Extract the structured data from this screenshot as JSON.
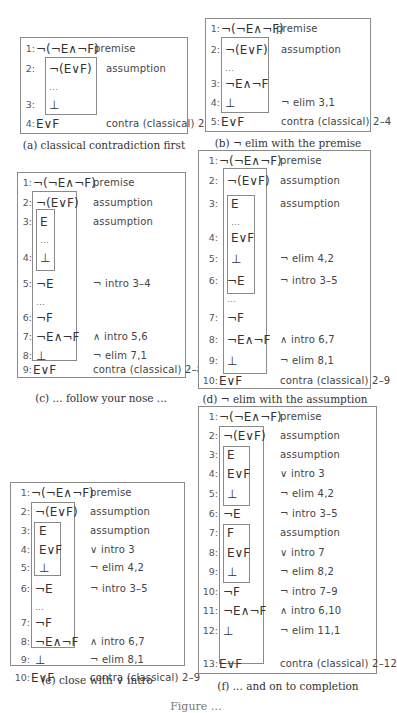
{
  "panels": [
    {
      "id": "a",
      "caption": "(a) classical contradiction first",
      "box": {
        "left": 20,
        "top": 37,
        "width": 168,
        "height": 97
      },
      "caption_top": 139,
      "caption_center": 104,
      "subproofs": [
        {
          "left": 24,
          "top": 19,
          "width": 52,
          "height": 58
        }
      ],
      "rows": [
        {
          "top": 2,
          "ln": "1:",
          "formula": "¬(¬E∧¬F)",
          "just": "premise",
          "just_left": 73
        },
        {
          "top": 22,
          "ln": "2:",
          "formula": "¬(E∨F)",
          "just": "assumption",
          "just_left": 85
        },
        {
          "top": 40,
          "dots": "…"
        },
        {
          "top": 58,
          "ln": "3:",
          "formula": "⊥",
          "just": ""
        },
        {
          "top": 77,
          "ln": "4:",
          "formula": "E∨F",
          "just": "contra (classical) 2–3",
          "just_left": 85
        }
      ]
    },
    {
      "id": "b",
      "caption": "(b) ¬ elim with the premise",
      "box": {
        "left": 205,
        "top": 18,
        "width": 166,
        "height": 114
      },
      "caption_top": 137,
      "caption_center": 288,
      "subproofs": [
        {
          "left": 15,
          "top": 18,
          "width": 48,
          "height": 76
        }
      ],
      "rows": [
        {
          "top": 1,
          "ln": "1:",
          "formula": "¬(¬E∧¬F)",
          "just": "premise",
          "just_left": 70
        },
        {
          "top": 22,
          "ln": "2:",
          "formula": "¬(E∨F)",
          "just": "assumption",
          "just_left": 75
        },
        {
          "top": 40,
          "dots": "…"
        },
        {
          "top": 56,
          "ln": "3:",
          "formula": "¬E∧¬F",
          "just": ""
        },
        {
          "top": 75,
          "ln": "4:",
          "formula": "⊥",
          "just": "¬ elim 3,1",
          "just_left": 75
        },
        {
          "top": 94,
          "ln": "5:",
          "formula": "E∨F",
          "just": "contra (classical) 2–4",
          "just_left": 75
        }
      ]
    },
    {
      "id": "c",
      "caption": "(c) ... follow your nose ...",
      "box": {
        "left": 17,
        "top": 172,
        "width": 169,
        "height": 206
      },
      "caption_top": 392,
      "caption_center": 101,
      "subproofs": [
        {
          "left": 14,
          "top": 18,
          "width": 45,
          "height": 170
        },
        {
          "left": 18,
          "top": 36,
          "width": 19,
          "height": 62
        }
      ],
      "rows": [
        {
          "top": 1,
          "ln": "1:",
          "formula": "¬(¬E∧¬F)",
          "just": "premise",
          "just_left": 75
        },
        {
          "top": 21,
          "ln": "2:",
          "formula": "¬(E∨F)",
          "just": "assumption",
          "just_left": 75
        },
        {
          "top": 40,
          "ln": "3:",
          "formula": "E",
          "just": "assumption",
          "just_left": 75,
          "indent": 1
        },
        {
          "top": 58,
          "dots": "…",
          "indent": 1
        },
        {
          "top": 76,
          "ln": "4:",
          "formula": "⊥",
          "just": "",
          "indent": 1
        },
        {
          "top": 102,
          "ln": "5:",
          "formula": "¬E",
          "just": "¬ intro 3–4",
          "just_left": 75
        },
        {
          "top": 120,
          "dots": "…"
        },
        {
          "top": 136,
          "ln": "6:",
          "formula": "¬F",
          "just": ""
        },
        {
          "top": 155,
          "ln": "7:",
          "formula": "¬E∧¬F",
          "just": "∧ intro 5,6",
          "just_left": 75
        },
        {
          "top": 174,
          "ln": "8:",
          "formula": "⊥",
          "just": "¬ elim 7,1",
          "just_left": 75
        },
        {
          "top": 188,
          "ln": "9:",
          "formula": "E∨F",
          "just": "contra (classical) 2–8",
          "just_left": 75
        }
      ]
    },
    {
      "id": "d",
      "caption": "(d) ¬ elim with the assumption",
      "box": {
        "left": 198,
        "top": 150,
        "width": 173,
        "height": 239
      },
      "caption_top": 393,
      "caption_center": 285,
      "subproofs": [
        {
          "left": 24,
          "top": 17,
          "width": 44,
          "height": 206
        },
        {
          "left": 28,
          "top": 44,
          "width": 28,
          "height": 99
        }
      ],
      "rows": [
        {
          "top": 1,
          "ln": "1:",
          "formula": "¬(¬E∧¬F)",
          "just": "premise",
          "just_left": 81
        },
        {
          "top": 21,
          "ln": "2:",
          "formula": "¬(E∨F)",
          "just": "assumption",
          "just_left": 81
        },
        {
          "top": 44,
          "ln": "3:",
          "formula": "E",
          "just": "assumption",
          "just_left": 81,
          "indent": 1
        },
        {
          "top": 62,
          "dots": "…",
          "indent": 1
        },
        {
          "top": 78,
          "ln": "4:",
          "formula": "E∨F",
          "just": "",
          "indent": 1
        },
        {
          "top": 99,
          "ln": "5:",
          "formula": "⊥",
          "just": "¬ elim 4,2",
          "just_left": 81,
          "indent": 1
        },
        {
          "top": 121,
          "ln": "6:",
          "formula": "¬E",
          "just": "¬ intro 3–5",
          "just_left": 81
        },
        {
          "top": 139,
          "dots": "…"
        },
        {
          "top": 158,
          "ln": "7:",
          "formula": "¬F",
          "just": ""
        },
        {
          "top": 180,
          "ln": "8:",
          "formula": "¬E∧¬F",
          "just": "∧ intro 6,7",
          "just_left": 81
        },
        {
          "top": 201,
          "ln": "9:",
          "formula": "⊥",
          "just": "¬ elim 8,1",
          "just_left": 81
        },
        {
          "top": 221,
          "ln": "10:",
          "formula": "E∨F",
          "just": "contra (classical) 2–9",
          "just_left": 81
        }
      ]
    },
    {
      "id": "e",
      "caption": "(e) close with ∨ intro",
      "box": {
        "left": 10,
        "top": 482,
        "width": 175,
        "height": 184
      },
      "caption_top": 674,
      "caption_center": 97,
      "subproofs": [
        {
          "left": 20,
          "top": 19,
          "width": 44,
          "height": 146
        },
        {
          "left": 23,
          "top": 39,
          "width": 27,
          "height": 54
        }
      ],
      "rows": [
        {
          "top": 1,
          "ln": "1:",
          "formula": "¬(¬E∧¬F)",
          "just": "premise",
          "just_left": 79
        },
        {
          "top": 20,
          "ln": "2:",
          "formula": "¬(E∨F)",
          "just": "assumption",
          "just_left": 79
        },
        {
          "top": 39,
          "ln": "3:",
          "formula": "E",
          "just": "assumption",
          "just_left": 79,
          "indent": 1
        },
        {
          "top": 58,
          "ln": "4:",
          "formula": "E∨F",
          "just": "∨ intro 3",
          "just_left": 79,
          "indent": 1
        },
        {
          "top": 76,
          "ln": "5:",
          "formula": "⊥",
          "just": "¬ elim 4,2",
          "just_left": 79,
          "indent": 1
        },
        {
          "top": 97,
          "ln": "6:",
          "formula": "¬E",
          "just": "¬ intro 3–5",
          "just_left": 79
        },
        {
          "top": 115,
          "dots": "…"
        },
        {
          "top": 131,
          "ln": "7:",
          "formula": "¬F",
          "just": ""
        },
        {
          "top": 150,
          "ln": "8:",
          "formula": "¬E∧¬F",
          "just": "∧ intro 6,7",
          "just_left": 79
        },
        {
          "top": 150,
          "skip": true
        },
        {
          "top": 168,
          "ln": "9:",
          "formula": "⊥",
          "just": "¬ elim 8,1",
          "just_left": 79
        },
        {
          "top": 186,
          "ln": "10:",
          "formula": "E∨F",
          "just": "contra (classical) 2–9",
          "just_left": 79
        }
      ]
    },
    {
      "id": "f",
      "caption": "(f) ... and on to completion",
      "box": {
        "left": 198,
        "top": 406,
        "width": 179,
        "height": 268
      },
      "caption_top": 680,
      "caption_center": 288,
      "subproofs": [
        {
          "left": 20,
          "top": 19,
          "width": 45,
          "height": 238
        },
        {
          "left": 24,
          "top": 39,
          "width": 27,
          "height": 60
        },
        {
          "left": 24,
          "top": 117,
          "width": 27,
          "height": 59
        }
      ],
      "rows": [
        {
          "top": 1,
          "ln": "1:",
          "formula": "¬(¬E∧¬F)",
          "just": "premise",
          "just_left": 81
        },
        {
          "top": 20,
          "ln": "2:",
          "formula": "¬(E∨F)",
          "just": "assumption",
          "just_left": 81
        },
        {
          "top": 39,
          "ln": "3:",
          "formula": "E",
          "just": "assumption",
          "just_left": 81,
          "indent": 1
        },
        {
          "top": 58,
          "ln": "4:",
          "formula": "E∨F",
          "just": "∨ intro 3",
          "just_left": 81,
          "indent": 1
        },
        {
          "top": 78,
          "ln": "5:",
          "formula": "⊥",
          "just": "¬ elim 4,2",
          "just_left": 81,
          "indent": 1
        },
        {
          "top": 98,
          "ln": "6:",
          "formula": "¬E",
          "just": "¬ intro 3–5",
          "just_left": 81
        },
        {
          "top": 117,
          "ln": "7:",
          "formula": "F",
          "just": "assumption",
          "just_left": 81,
          "indent": 1
        },
        {
          "top": 137,
          "ln": "8:",
          "formula": "E∨F",
          "just": "∨ intro 7",
          "just_left": 81,
          "indent": 1
        },
        {
          "top": 156,
          "ln": "9:",
          "formula": "⊥",
          "just": "¬ elim 8,2",
          "just_left": 81,
          "indent": 1
        },
        {
          "top": 176,
          "ln": "10:",
          "formula": "¬F",
          "just": "¬ intro 7–9",
          "just_left": 81
        },
        {
          "top": 195,
          "ln": "11:",
          "formula": "¬E∧¬F",
          "just": "∧ intro 6,10",
          "just_left": 81
        },
        {
          "top": 215,
          "ln": "12:",
          "formula": "⊥",
          "just": "¬ elim 11,1",
          "just_left": 81
        },
        {
          "top": 248,
          "ln": "13:",
          "formula": "E∨F",
          "just": "contra (classical) 2–12",
          "just_left": 81
        }
      ]
    }
  ],
  "figure_caption": "Figure …"
}
